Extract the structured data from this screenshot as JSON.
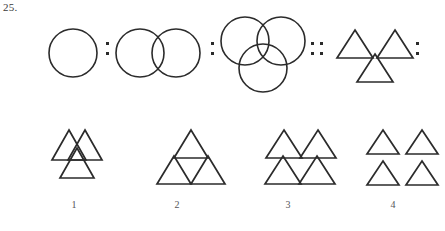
{
  "question": {
    "number_label": "25.",
    "type": "visual-analogy-puzzle"
  },
  "colors": {
    "stroke": "#2b2b2b",
    "background": "#ffffff",
    "label_text": "#55555a",
    "qnum_text": "#3a3a3a"
  },
  "prompt_row": {
    "terms": [
      {
        "id": "term-1",
        "shape": "circle",
        "count": 1,
        "arrangement": "single",
        "overlapping": false
      },
      {
        "id": "term-2",
        "shape": "circle",
        "count": 2,
        "arrangement": "side-by-side",
        "overlapping": true
      },
      {
        "id": "term-3",
        "shape": "circle",
        "count": 3,
        "arrangement": "two-top-one-bottom",
        "overlapping": true
      },
      {
        "id": "term-4",
        "shape": "triangle",
        "count": 3,
        "arrangement": "two-top-one-bottom",
        "overlapping": false
      }
    ],
    "separators": [
      {
        "id": "sep-1",
        "glyph": ":",
        "dots": 2
      },
      {
        "id": "sep-2",
        "glyph": ":",
        "dots": 2
      },
      {
        "id": "sep-3",
        "glyph": "::",
        "dots": 4
      },
      {
        "id": "sep-4",
        "glyph": ":",
        "dots": 2
      }
    ]
  },
  "options": [
    {
      "label": "1",
      "shape": "triangle",
      "count": 3,
      "arrangement": "two-top-one-bottom",
      "overlapping": true
    },
    {
      "label": "2",
      "shape": "triangle",
      "count": 3,
      "arrangement": "large-triangle-subdivided",
      "overlapping": false
    },
    {
      "label": "3",
      "shape": "triangle",
      "count": 4,
      "arrangement": "two-by-two-touching",
      "overlapping": false
    },
    {
      "label": "4",
      "shape": "triangle",
      "count": 4,
      "arrangement": "two-by-two-separated",
      "overlapping": false
    }
  ]
}
